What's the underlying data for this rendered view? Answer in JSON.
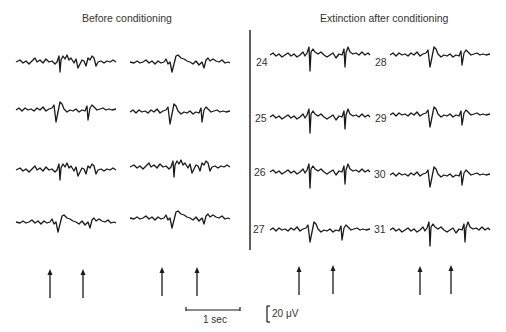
{
  "figure": {
    "left_panel": {
      "title": "Before conditioning",
      "columns": 2,
      "rows": 4
    },
    "right_panel": {
      "title": "Extinction after conditioning",
      "trial_numbers_col1": [
        "24",
        "25",
        "26",
        "27"
      ],
      "trial_numbers_col2": [
        "28",
        "29",
        "30",
        "31"
      ]
    },
    "stimulus_markers": {
      "icon": "up-arrow-icon",
      "count": 8
    },
    "scale_bars": {
      "time_label": "1 sec",
      "voltage_label": "20 μV"
    },
    "colors": {
      "trace": "#1a1a1a",
      "background": "#ffffff"
    }
  }
}
